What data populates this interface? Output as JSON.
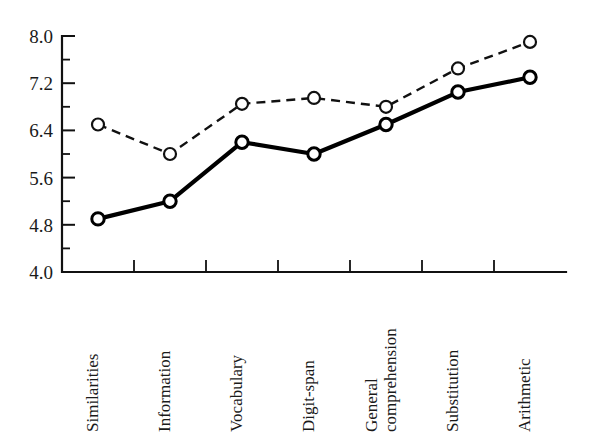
{
  "chart_data": {
    "type": "line",
    "title": "",
    "subtitle": "",
    "xlabel": "",
    "ylabel": "",
    "ylim": [
      4.0,
      8.0
    ],
    "grid": false,
    "legend_position": "none",
    "categories": [
      "Similarities",
      "Information",
      "Vocabulary",
      "Digit-span",
      "General comprehension",
      "Substitution",
      "Arithmetic"
    ],
    "category_lines": [
      [
        "Similarities"
      ],
      [
        "Information"
      ],
      [
        "Vocabulary"
      ],
      [
        "Digit-span"
      ],
      [
        "General",
        "comprehension"
      ],
      [
        "Substitution"
      ],
      [
        "Arithmetic"
      ]
    ],
    "ytick_labels": [
      "4.0",
      "4.8",
      "5.6",
      "6.4",
      "7.2",
      "8.0"
    ],
    "ytick_values": [
      4.0,
      4.8,
      5.6,
      6.4,
      7.2,
      8.0
    ],
    "yminor_values": [
      4.4,
      5.2,
      6.0,
      6.8,
      7.6
    ],
    "series": [
      {
        "name": "upper-dashed",
        "style": "dashed",
        "marker": "open-circle",
        "values": [
          6.5,
          6.0,
          6.85,
          6.95,
          6.8,
          7.45,
          7.9
        ]
      },
      {
        "name": "lower-solid",
        "style": "solid",
        "marker": "open-circle",
        "values": [
          4.9,
          5.2,
          6.2,
          6.0,
          6.5,
          7.05,
          7.3
        ]
      }
    ]
  }
}
